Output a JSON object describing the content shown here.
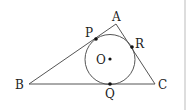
{
  "figure": {
    "stroke_color": "#555555",
    "border_color": "#bbbbbb",
    "points": {
      "A": {
        "label": "A",
        "x": 116,
        "y": 24
      },
      "B": {
        "label": "B",
        "x": 29,
        "y": 84
      },
      "C": {
        "label": "C",
        "x": 155,
        "y": 84
      },
      "O": {
        "label": "O",
        "x": 110,
        "y": 59
      },
      "P": {
        "label": "P",
        "x": 96,
        "y": 39
      },
      "Q": {
        "label": "Q",
        "x": 110,
        "y": 84
      },
      "R": {
        "label": "R",
        "x": 132,
        "y": 47
      }
    },
    "circle": {
      "cx": 110,
      "cy": 59.5,
      "r": 25
    }
  }
}
